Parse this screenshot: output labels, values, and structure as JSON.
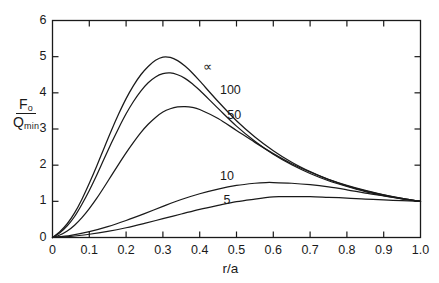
{
  "figure": {
    "background": "#ffffff",
    "line_color": "#1a1a1a",
    "axis_color": "#1a1a1a"
  },
  "chart_data": {
    "type": "line",
    "title": "",
    "subtitle": "",
    "xlabel": "r/a",
    "ylabel": "F₀/Q_min",
    "ylabel_numerator": "F",
    "ylabel_numerator_sub": "o",
    "ylabel_denominator": "Q",
    "ylabel_denominator_sub": "min",
    "xlim": [
      0,
      1.0
    ],
    "ylim": [
      0,
      6
    ],
    "xticks": [
      0,
      0.1,
      0.2,
      0.3,
      0.4,
      0.5,
      0.6,
      0.7,
      0.8,
      0.9,
      1.0
    ],
    "xticklabels": [
      "0",
      "0.1",
      "0.2",
      "0.3",
      "0.4",
      "0.5",
      "0.6",
      "0.7",
      "0.8",
      "0.9",
      "1.0"
    ],
    "yticks": [
      0,
      1,
      2,
      3,
      4,
      5,
      6
    ],
    "yticklabels": [
      "0",
      "1",
      "2",
      "3",
      "4",
      "5",
      "6"
    ],
    "grid": false,
    "legend_position": "inline-annotations",
    "tick_direction": "in",
    "frame": "box",
    "series": [
      {
        "name": "∝",
        "label": "∝",
        "label_x": 0.41,
        "label_y": 4.72,
        "peak_x": 0.3,
        "peak_y": 5.0,
        "x": [
          0.0,
          0.02,
          0.04,
          0.06,
          0.08,
          0.1,
          0.12,
          0.14,
          0.16,
          0.18,
          0.2,
          0.22,
          0.24,
          0.26,
          0.28,
          0.3,
          0.32,
          0.34,
          0.36,
          0.38,
          0.4,
          0.45,
          0.5,
          0.55,
          0.6,
          0.65,
          0.7,
          0.75,
          0.8,
          0.85,
          0.9,
          0.95,
          1.0
        ],
        "y": [
          0.0,
          0.16,
          0.38,
          0.68,
          1.06,
          1.5,
          1.97,
          2.47,
          2.96,
          3.42,
          3.84,
          4.2,
          4.5,
          4.73,
          4.9,
          4.99,
          4.98,
          4.89,
          4.74,
          4.55,
          4.33,
          3.76,
          3.23,
          2.78,
          2.4,
          2.08,
          1.82,
          1.6,
          1.43,
          1.29,
          1.18,
          1.08,
          1.0
        ]
      },
      {
        "name": "100",
        "label": "100",
        "label_x": 0.455,
        "label_y": 4.05,
        "peak_x": 0.31,
        "peak_y": 4.55,
        "x": [
          0.0,
          0.02,
          0.04,
          0.06,
          0.08,
          0.1,
          0.12,
          0.14,
          0.16,
          0.18,
          0.2,
          0.22,
          0.24,
          0.26,
          0.28,
          0.3,
          0.32,
          0.34,
          0.36,
          0.38,
          0.4,
          0.45,
          0.5,
          0.55,
          0.6,
          0.65,
          0.7,
          0.75,
          0.8,
          0.85,
          0.9,
          0.95,
          1.0
        ],
        "y": [
          0.0,
          0.13,
          0.32,
          0.58,
          0.92,
          1.3,
          1.72,
          2.17,
          2.61,
          3.03,
          3.42,
          3.76,
          4.05,
          4.28,
          4.44,
          4.53,
          4.55,
          4.5,
          4.4,
          4.25,
          4.07,
          3.57,
          3.08,
          2.66,
          2.3,
          2.01,
          1.77,
          1.57,
          1.41,
          1.27,
          1.16,
          1.07,
          1.0
        ]
      },
      {
        "name": "50",
        "label": "50",
        "label_x": 0.475,
        "label_y": 3.37,
        "peak_x": 0.355,
        "peak_y": 3.62,
        "x": [
          0.0,
          0.02,
          0.04,
          0.06,
          0.08,
          0.1,
          0.12,
          0.14,
          0.16,
          0.18,
          0.2,
          0.22,
          0.24,
          0.26,
          0.28,
          0.3,
          0.32,
          0.34,
          0.36,
          0.38,
          0.4,
          0.45,
          0.5,
          0.55,
          0.6,
          0.65,
          0.7,
          0.75,
          0.8,
          0.85,
          0.9,
          0.95,
          1.0
        ],
        "y": [
          0.0,
          0.07,
          0.18,
          0.34,
          0.55,
          0.8,
          1.08,
          1.39,
          1.71,
          2.03,
          2.34,
          2.63,
          2.9,
          3.13,
          3.32,
          3.47,
          3.56,
          3.61,
          3.62,
          3.6,
          3.54,
          3.29,
          2.96,
          2.63,
          2.32,
          2.04,
          1.81,
          1.61,
          1.44,
          1.3,
          1.18,
          1.08,
          1.0
        ]
      },
      {
        "name": "10",
        "label": "10",
        "label_x": 0.455,
        "label_y": 1.67,
        "peak_x": 0.58,
        "peak_y": 1.52,
        "x": [
          0.0,
          0.05,
          0.1,
          0.15,
          0.2,
          0.25,
          0.3,
          0.35,
          0.4,
          0.45,
          0.5,
          0.55,
          0.58,
          0.6,
          0.65,
          0.7,
          0.75,
          0.8,
          0.85,
          0.9,
          0.95,
          1.0
        ],
        "y": [
          0.0,
          0.06,
          0.16,
          0.3,
          0.47,
          0.66,
          0.86,
          1.05,
          1.21,
          1.34,
          1.44,
          1.5,
          1.52,
          1.52,
          1.5,
          1.46,
          1.4,
          1.32,
          1.23,
          1.15,
          1.07,
          1.0
        ]
      },
      {
        "name": "5",
        "label": "5",
        "label_x": 0.465,
        "label_y": 1.02,
        "peak_x": 0.62,
        "peak_y": 1.13,
        "x": [
          0.0,
          0.05,
          0.1,
          0.15,
          0.2,
          0.25,
          0.3,
          0.35,
          0.4,
          0.45,
          0.5,
          0.55,
          0.6,
          0.62,
          0.65,
          0.7,
          0.75,
          0.8,
          0.85,
          0.9,
          0.95,
          1.0
        ],
        "y": [
          0.0,
          0.03,
          0.09,
          0.17,
          0.27,
          0.39,
          0.52,
          0.65,
          0.78,
          0.89,
          0.99,
          1.06,
          1.12,
          1.13,
          1.13,
          1.13,
          1.11,
          1.09,
          1.06,
          1.04,
          1.02,
          1.0
        ]
      }
    ]
  }
}
